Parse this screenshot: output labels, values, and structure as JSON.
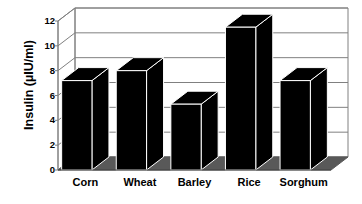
{
  "chart_data": {
    "type": "bar",
    "title": "",
    "subtitle": "",
    "xlabel": "",
    "ylabel": "Insulin (µIU/ml)",
    "categories": [
      "Corn",
      "Wheat",
      "Barley",
      "Rice",
      "Sorghum"
    ],
    "values": [
      7.2,
      8.0,
      5.3,
      11.5,
      7.2
    ],
    "series": [
      {
        "name": "Insulin",
        "values": [
          7.2,
          8.0,
          5.3,
          11.5,
          7.2
        ]
      }
    ],
    "ylim": [
      0,
      12
    ],
    "ytick_values": [
      0,
      2,
      4,
      6,
      8,
      10,
      12
    ],
    "ytick_labels": [
      "0",
      "2",
      "4",
      "6",
      "8",
      "10",
      "12"
    ],
    "grid": true,
    "grid_axis": "y",
    "legend": false,
    "legend_position": "none",
    "style": "3d-column",
    "bar_color": "#000000",
    "bar_edge_color": "#ffffff",
    "floor_color": "#595959",
    "grid_color": "#808080",
    "axis_color": "#808080",
    "background_color": "#ffffff",
    "annotations": []
  },
  "axes": {
    "y_title": "Insulin (µIU/ml)"
  }
}
